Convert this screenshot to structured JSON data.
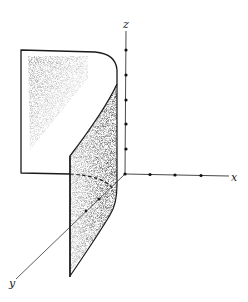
{
  "figure": {
    "type": "3d-surface-diagram",
    "axes": {
      "x": {
        "label": "x",
        "tick_count": 3
      },
      "y": {
        "label": "y",
        "tick_count": 2
      },
      "z": {
        "label": "z",
        "tick_count": 5
      }
    },
    "colors": {
      "line": "#1a1a1a",
      "shade": "#555555",
      "background": "#ffffff"
    }
  }
}
